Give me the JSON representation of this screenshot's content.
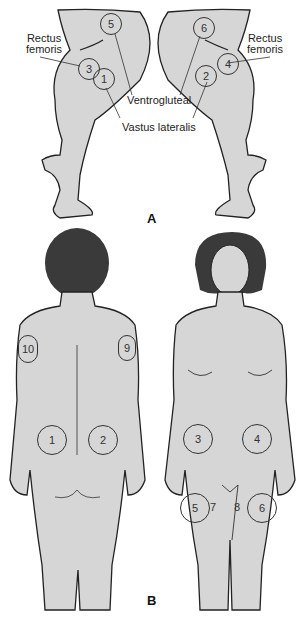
{
  "figure": {
    "panel_a": {
      "label": "A",
      "labels": {
        "rectus_femoris_left": "Rectus\nfemoris",
        "rectus_femoris_right": "Rectus\nfemoris",
        "ventrogluteal": "Ventrogluteal",
        "vastus_lateralis": "Vastus lateralis"
      },
      "sites": {
        "s1": "1",
        "s2": "2",
        "s3": "3",
        "s4": "4",
        "s5": "5",
        "s6": "6"
      }
    },
    "panel_b": {
      "label": "B",
      "back_sites": {
        "s1": "1",
        "s2": "2",
        "s9": "9",
        "s10": "10"
      },
      "front_sites": {
        "s3": "3",
        "s4": "4",
        "s5": "5",
        "s6": "6",
        "s7": "7",
        "s8": "8"
      }
    },
    "colors": {
      "skin": "#d6d6d6",
      "hair": "#3a3a3a",
      "outline": "#222222",
      "background": "#ffffff"
    }
  }
}
